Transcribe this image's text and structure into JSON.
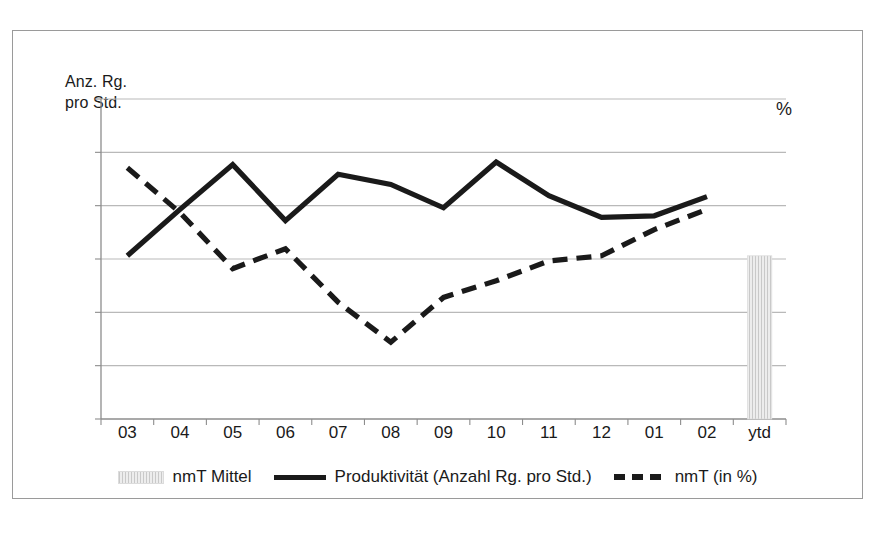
{
  "axis_titles": {
    "y_primary": "Anz. Rg.\npro Std.",
    "y_secondary": "%"
  },
  "legend": {
    "items": [
      {
        "label": "nmT Mittel",
        "marker": "bar-swatch",
        "color": "#c9c9c9"
      },
      {
        "label": "Produktivität (Anzahl Rg. pro Std.)",
        "marker": "solid-line",
        "color": "#1a1a1a"
      },
      {
        "label": "nmT (in %)",
        "marker": "dashed-line",
        "color": "#1a1a1a"
      }
    ]
  },
  "chart_data": {
    "type": "line",
    "title": "",
    "xlabel": "",
    "ylabel": "Anz. Rg. pro Std.",
    "y2label": "%",
    "grid": true,
    "legend_position": "bottom",
    "categories": [
      "03",
      "04",
      "05",
      "06",
      "07",
      "08",
      "09",
      "10",
      "11",
      "12",
      "01",
      "02",
      "ytd"
    ],
    "gridline_count": 7,
    "series": [
      {
        "name": "Produktivität (Anzahl Rg. pro Std.)",
        "style": "solid",
        "color": "#1a1a1a",
        "axis": "left",
        "values": [
          5.1,
          6.55,
          7.95,
          6.2,
          7.65,
          7.33,
          6.6,
          8.03,
          6.98,
          6.3,
          6.35,
          6.95,
          null
        ]
      },
      {
        "name": "nmT (in %)",
        "style": "dashed",
        "color": "#1a1a1a",
        "axis": "right",
        "values": [
          7.85,
          6.45,
          4.7,
          5.32,
          3.65,
          2.4,
          3.8,
          4.32,
          4.94,
          5.1,
          5.92,
          6.55,
          null
        ]
      },
      {
        "name": "nmT Mittel",
        "style": "bar",
        "color": "#c9c9c9",
        "axis": "right",
        "values": [
          null,
          null,
          null,
          null,
          null,
          null,
          null,
          null,
          null,
          null,
          null,
          null,
          5.1
        ]
      }
    ],
    "ylim": [
      0,
      10
    ]
  }
}
